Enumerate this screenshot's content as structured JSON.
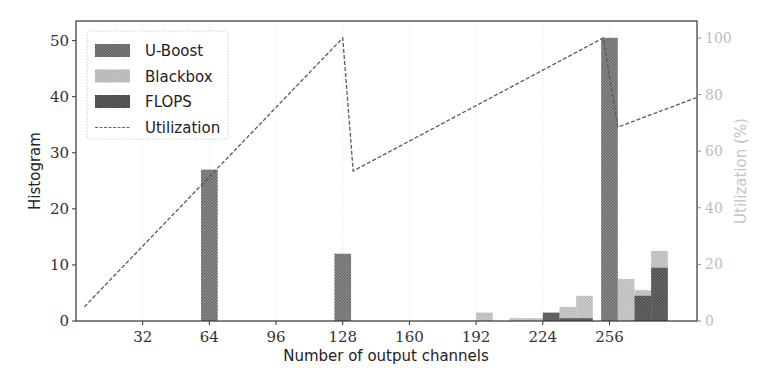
{
  "chart_data": {
    "type": "bar",
    "title": "",
    "xlabel": "Number of output channels",
    "ylabel": "Histogram",
    "y2label": "Utilization (%)",
    "xlim": [
      0,
      298
    ],
    "ylim": [
      0,
      53.5
    ],
    "y2lim": [
      0,
      106
    ],
    "xticks": [
      32,
      64,
      96,
      128,
      160,
      192,
      224,
      256
    ],
    "yticks": [
      0,
      10,
      20,
      30,
      40,
      50
    ],
    "y2ticks": [
      0,
      20,
      40,
      60,
      80,
      100
    ],
    "grid": "vertical dotted at x ticks",
    "bin_width": 8,
    "legend_position": "upper left",
    "series": [
      {
        "name": "U-Boost",
        "kind": "bar",
        "color": "#6e6e6e",
        "bins": [
          {
            "x": 64,
            "value": 27
          },
          {
            "x": 128,
            "value": 12
          },
          {
            "x": 256,
            "value": 50.5
          }
        ]
      },
      {
        "name": "Blackbox",
        "kind": "bar",
        "color": "#b9b9b9",
        "bins": [
          {
            "x": 196,
            "value": 1.5
          },
          {
            "x": 212,
            "value": 0.5
          },
          {
            "x": 220,
            "value": 0.5
          },
          {
            "x": 236,
            "value": 2.5
          },
          {
            "x": 244,
            "value": 4.5
          },
          {
            "x": 264,
            "value": 7.5
          },
          {
            "x": 272,
            "value": 5.5
          },
          {
            "x": 280,
            "value": 12.5
          }
        ]
      },
      {
        "name": "FLOPS",
        "kind": "bar",
        "color": "#4a4a4a",
        "bins": [
          {
            "x": 228,
            "value": 1.5
          },
          {
            "x": 236,
            "value": 0.5
          },
          {
            "x": 244,
            "value": 0.5
          },
          {
            "x": 272,
            "value": 4.5
          },
          {
            "x": 280,
            "value": 9.5
          }
        ]
      },
      {
        "name": "Utilization",
        "kind": "line",
        "axis": "right",
        "color": "#555555",
        "points": [
          {
            "x": 4,
            "y": 5
          },
          {
            "x": 128,
            "y": 100
          },
          {
            "x": 133,
            "y": 53
          },
          {
            "x": 253,
            "y": 100
          },
          {
            "x": 260,
            "y": 68.5
          },
          {
            "x": 298,
            "y": 79
          }
        ]
      }
    ]
  },
  "legend": {
    "items": [
      {
        "label": "U-Boost",
        "swatch": "#6e6e6e"
      },
      {
        "label": "Blackbox",
        "swatch": "#b9b9b9"
      },
      {
        "label": "FLOPS",
        "swatch": "#4a4a4a"
      },
      {
        "label": "Utilization",
        "swatch": "dashed-line"
      }
    ]
  }
}
